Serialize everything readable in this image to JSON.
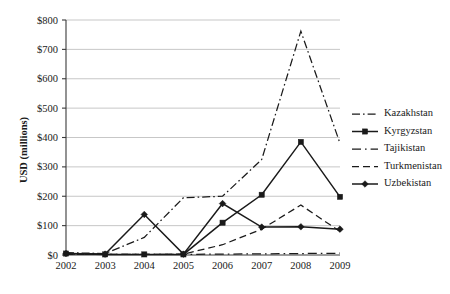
{
  "chart_data": {
    "type": "line",
    "title": "",
    "xlabel": "",
    "ylabel": "USD (millions)",
    "x": [
      2002,
      2003,
      2004,
      2005,
      2006,
      2007,
      2008,
      2009
    ],
    "categories": [
      "2002",
      "2003",
      "2004",
      "2005",
      "2006",
      "2007",
      "2008",
      "2009"
    ],
    "ylim": [
      0,
      800
    ],
    "ytick_values": [
      0,
      100,
      200,
      300,
      400,
      500,
      600,
      700,
      800
    ],
    "ytick_labels": [
      "$0",
      "$100",
      "$200",
      "$300",
      "$400",
      "$500",
      "$600",
      "$700",
      "$800"
    ],
    "grid": true,
    "legend_position": "right",
    "series": [
      {
        "name": "Kazakhstan",
        "values": [
          8,
          5,
          60,
          195,
          200,
          325,
          762,
          380
        ],
        "line_style": "dash-dot",
        "marker": "none"
      },
      {
        "name": "Kyrgyzstan",
        "values": [
          5,
          2,
          2,
          2,
          110,
          205,
          385,
          198
        ],
        "line_style": "solid",
        "marker": "square"
      },
      {
        "name": "Tajikistan",
        "values": [
          3,
          2,
          2,
          2,
          3,
          4,
          5,
          6
        ],
        "line_style": "long-dash-dot",
        "marker": "none"
      },
      {
        "name": "Turkmenistan",
        "values": [
          2,
          2,
          2,
          3,
          35,
          88,
          170,
          80
        ],
        "line_style": "dashed",
        "marker": "none"
      },
      {
        "name": "Uzbekistan",
        "values": [
          5,
          3,
          138,
          3,
          175,
          95,
          96,
          88
        ],
        "line_style": "solid",
        "marker": "diamond"
      }
    ]
  },
  "legend": {
    "items": [
      {
        "label": "Kazakhstan"
      },
      {
        "label": "Kyrgyzstan"
      },
      {
        "label": "Tajikistan"
      },
      {
        "label": "Turkmenistan"
      },
      {
        "label": "Uzbekistan"
      }
    ]
  },
  "colors": {
    "ink": "#1a1a1a",
    "gridline": "#b9b9b9",
    "axis": "#3a3a3a",
    "background": "#ffffff"
  }
}
